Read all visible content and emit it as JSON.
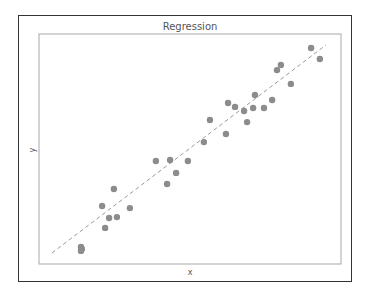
{
  "chart_data": {
    "type": "scatter",
    "title": "Regression",
    "xlabel": "x",
    "ylabel": "y",
    "xlim": [
      0,
      10
    ],
    "ylim": [
      0,
      10
    ],
    "grid": false,
    "legend": null,
    "ticks": "none",
    "series": [
      {
        "name": "observations",
        "x": [
          1.39,
          1.42,
          1.39,
          2.09,
          2.19,
          2.32,
          2.48,
          2.58,
          3.01,
          3.87,
          4.24,
          4.34,
          4.54,
          4.93,
          5.46,
          5.66,
          6.19,
          6.26,
          6.49,
          6.79,
          6.89,
          7.09,
          7.15,
          7.45,
          7.72,
          7.88,
          8.01,
          8.34,
          9.01,
          9.3
        ],
        "y": [
          0.74,
          0.65,
          0.57,
          2.52,
          1.57,
          2.0,
          3.26,
          2.04,
          2.43,
          4.48,
          3.48,
          4.52,
          3.96,
          4.48,
          5.3,
          6.26,
          5.65,
          7.0,
          6.83,
          6.65,
          6.17,
          6.78,
          7.35,
          6.78,
          7.13,
          8.43,
          8.65,
          7.83,
          9.39,
          8.91
        ]
      }
    ],
    "regression_line": {
      "style": "dashed",
      "x": [
        0.43,
        9.5
      ],
      "y": [
        0.48,
        9.52
      ]
    },
    "colors": {
      "points": "#8c8c8c",
      "line": "#9a9a9a",
      "frame": "#333333",
      "axes": "#a8a8a8"
    }
  }
}
